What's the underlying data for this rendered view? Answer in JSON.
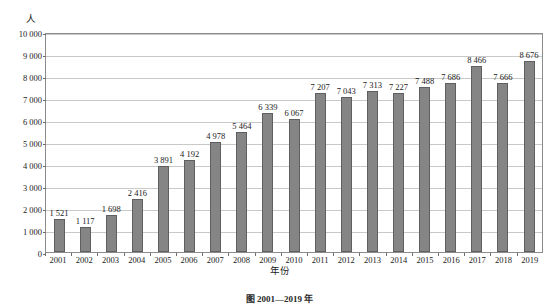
{
  "chart_data": {
    "type": "bar",
    "title": "",
    "xlabel": "年份",
    "ylabel": "人",
    "ylim": [
      0,
      10000
    ],
    "ytick_labels": [
      "10 000",
      "9 000",
      "8 000",
      "7 000",
      "6 000",
      "5 000",
      "4 000",
      "3 000",
      "2 000",
      "1 000",
      "0"
    ],
    "ytick_values": [
      10000,
      9000,
      8000,
      7000,
      6000,
      5000,
      4000,
      3000,
      2000,
      1000,
      0
    ],
    "grid": true,
    "legend": "none",
    "categories": [
      "2001",
      "2002",
      "2003",
      "2004",
      "2005",
      "2006",
      "2007",
      "2008",
      "2009",
      "2010",
      "2011",
      "2012",
      "2013",
      "2014",
      "2015",
      "2016",
      "2017",
      "2018",
      "2019"
    ],
    "values": [
      1521,
      1117,
      1698,
      2416,
      3891,
      4192,
      4978,
      5464,
      6339,
      6067,
      7207,
      7043,
      7313,
      7227,
      7488,
      7686,
      8466,
      7666,
      8676
    ],
    "value_labels": [
      "1 521",
      "1 117",
      "1 698",
      "2 416",
      "3 891",
      "4 192",
      "4 978",
      "5 464",
      "6 339",
      "6 067",
      "7 207",
      "7 043",
      "7 313",
      "7 227",
      "7 488",
      "7 686",
      "8 466",
      "7 666",
      "8 676"
    ],
    "bar_color": "#858585",
    "bar_border_color": "#5f5f5f",
    "gridline_color": "#c9c9c9",
    "frame_color": "#8c8c8c"
  },
  "axis": {
    "y_unit_label": "人",
    "x_title": "年份"
  },
  "caption": {
    "text": "图 2001—2019 年"
  }
}
